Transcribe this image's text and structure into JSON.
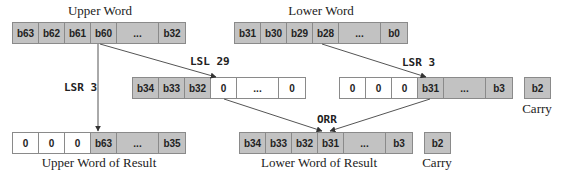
{
  "upper_word": {
    "title": "Upper Word",
    "cells": [
      {
        "label": "b63",
        "fill": "gray"
      },
      {
        "label": "b62",
        "fill": "gray"
      },
      {
        "label": "b61",
        "fill": "gray"
      },
      {
        "label": "b60",
        "fill": "gray"
      },
      {
        "label": "...",
        "fill": "gray"
      },
      {
        "label": "b32",
        "fill": "gray"
      }
    ]
  },
  "lower_word": {
    "title": "Lower Word",
    "cells": [
      {
        "label": "b31",
        "fill": "gray"
      },
      {
        "label": "b30",
        "fill": "gray"
      },
      {
        "label": "b29",
        "fill": "gray"
      },
      {
        "label": "b28",
        "fill": "gray"
      },
      {
        "label": "...",
        "fill": "gray"
      },
      {
        "label": "b0",
        "fill": "gray"
      }
    ]
  },
  "operations": {
    "lsr_upper": "LSR 3",
    "lsl": "LSL 29",
    "lsr_lower": "LSR 3",
    "orr": "ORR"
  },
  "shifted_upper": {
    "cells": [
      {
        "label": "b34",
        "fill": "gray"
      },
      {
        "label": "b33",
        "fill": "gray"
      },
      {
        "label": "b32",
        "fill": "gray"
      },
      {
        "label": "0",
        "fill": "white"
      },
      {
        "label": "...",
        "fill": "white"
      },
      {
        "label": "0",
        "fill": "white"
      }
    ]
  },
  "shifted_lower": {
    "cells": [
      {
        "label": "0",
        "fill": "white"
      },
      {
        "label": "0",
        "fill": "white"
      },
      {
        "label": "0",
        "fill": "white"
      },
      {
        "label": "b31",
        "fill": "gray"
      },
      {
        "label": "...",
        "fill": "gray"
      },
      {
        "label": "b3",
        "fill": "gray"
      }
    ],
    "carry": {
      "label": "b2",
      "caption": "Carry"
    }
  },
  "upper_result": {
    "title": "Upper Word of Result",
    "cells": [
      {
        "label": "0",
        "fill": "white"
      },
      {
        "label": "0",
        "fill": "white"
      },
      {
        "label": "0",
        "fill": "white"
      },
      {
        "label": "b63",
        "fill": "gray"
      },
      {
        "label": "...",
        "fill": "gray"
      },
      {
        "label": "b35",
        "fill": "gray"
      }
    ]
  },
  "lower_result": {
    "title": "Lower Word of Result",
    "cells": [
      {
        "label": "b34",
        "fill": "gray"
      },
      {
        "label": "b33",
        "fill": "gray"
      },
      {
        "label": "b32",
        "fill": "gray"
      },
      {
        "label": "b31",
        "fill": "gray"
      },
      {
        "label": "...",
        "fill": "gray"
      },
      {
        "label": "b3",
        "fill": "gray"
      }
    ],
    "carry": {
      "label": "b2",
      "caption": "Carry"
    }
  },
  "colors": {
    "bit_fill": "#c2c2c2",
    "zero_fill": "#ffffff",
    "border": "#8a8a8a",
    "arrow": "#333333"
  }
}
